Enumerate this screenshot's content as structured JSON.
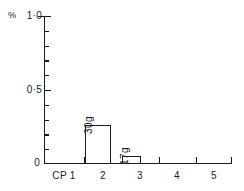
{
  "figure": {
    "width": 244,
    "height": 191,
    "background_color": "#ffffff",
    "ink_color": "#1c1c1c"
  },
  "chart_data": {
    "type": "bar",
    "title": "",
    "subtitle": "",
    "xlabel": "",
    "ylabel": "%",
    "categories": [
      "CP 1",
      "2",
      "3",
      "4",
      "5"
    ],
    "values": [
      0,
      0.26,
      0.05,
      0,
      0
    ],
    "bar_labels": [
      "",
      "30g",
      "17g",
      "",
      ""
    ],
    "ylim": [
      0,
      1.0
    ],
    "xlim": [
      0.5,
      5.5
    ],
    "y_major_ticks": [
      0,
      0.5,
      1.0
    ],
    "y_major_tick_labels": [
      "0",
      "0·5",
      "1·0"
    ],
    "y_minor_ticks": [
      0.1,
      0.2,
      0.3,
      0.4,
      0.6,
      0.7,
      0.8,
      0.9
    ],
    "x_tick_labels": [
      "CP 1",
      "2",
      "3",
      "4",
      "5"
    ],
    "grid": false,
    "legend": null,
    "bar_fill": "none",
    "bar_edge_color": "#1c1c1c",
    "annotations": [
      {
        "category": "2",
        "text": "30g",
        "rotation": -90
      },
      {
        "category": "3",
        "text": "17g",
        "rotation": -90
      }
    ]
  },
  "axis": {
    "y_unit_symbol": "%",
    "y_tick_top": "1·0",
    "y_tick_mid": "0·5",
    "y_tick_bottom": "0",
    "x_tick_1": "CP 1",
    "x_tick_2": "2",
    "x_tick_3": "3",
    "x_tick_4": "4",
    "x_tick_5": "5"
  },
  "bars": [
    {
      "label": "30g",
      "category": "2",
      "value": 0.26
    },
    {
      "label": "17g",
      "category": "3",
      "value": 0.05
    }
  ]
}
